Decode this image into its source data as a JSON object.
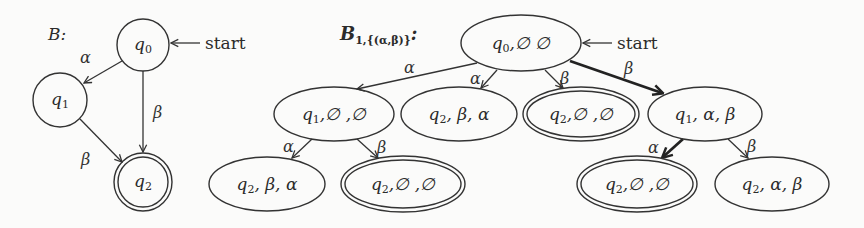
{
  "diagram_left": {
    "title": "B:",
    "start_label": "start",
    "nodes": [
      {
        "state": "q",
        "sub": "0",
        "accepting": false
      },
      {
        "state": "q",
        "sub": "1",
        "accepting": false
      },
      {
        "state": "q",
        "sub": "2",
        "accepting": true
      }
    ],
    "edges": [
      {
        "from": "q0",
        "to": "q1",
        "label": "α"
      },
      {
        "from": "q0",
        "to": "q2",
        "label": "β"
      },
      {
        "from": "q1",
        "to": "q2",
        "label": "β"
      }
    ]
  },
  "diagram_right": {
    "title_main": "B",
    "title_sub": "1,{(α,β)}",
    "title_colon": ":",
    "start_label": "start",
    "nodes": [
      {
        "state": "q",
        "sub": "0",
        "rest": ",∅  ∅",
        "accepting": false
      },
      {
        "state": "q",
        "sub": "1",
        "rest": ",∅ ,∅",
        "accepting": false
      },
      {
        "state": "q",
        "sub": "2",
        "rest": ", β, α",
        "accepting": false
      },
      {
        "state": "q",
        "sub": "2",
        "rest": ",∅ ,∅",
        "accepting": true
      },
      {
        "state": "q",
        "sub": "1",
        "rest": ", α, β",
        "accepting": false
      },
      {
        "state": "q",
        "sub": "2",
        "rest": ", β, α",
        "accepting": false
      },
      {
        "state": "q",
        "sub": "2",
        "rest": ",∅ ,∅",
        "accepting": true
      },
      {
        "state": "q",
        "sub": "2",
        "rest": ",∅ ,∅",
        "accepting": true
      },
      {
        "state": "q",
        "sub": "2",
        "rest": ", α, β",
        "accepting": false
      }
    ],
    "edges": [
      {
        "from": 0,
        "to": 1,
        "label": "α",
        "highlighted": false
      },
      {
        "from": 0,
        "to": 2,
        "label": "α",
        "highlighted": false
      },
      {
        "from": 0,
        "to": 3,
        "label": "β",
        "highlighted": false
      },
      {
        "from": 0,
        "to": 4,
        "label": "β",
        "highlighted": true
      },
      {
        "from": 1,
        "to": 5,
        "label": "α",
        "highlighted": false
      },
      {
        "from": 1,
        "to": 6,
        "label": "β",
        "highlighted": false
      },
      {
        "from": 4,
        "to": 7,
        "label": "α",
        "highlighted": true
      },
      {
        "from": 4,
        "to": 8,
        "label": "β",
        "highlighted": false
      }
    ]
  },
  "colors": {
    "background": "#fbfbfa",
    "stroke": "#333333"
  }
}
